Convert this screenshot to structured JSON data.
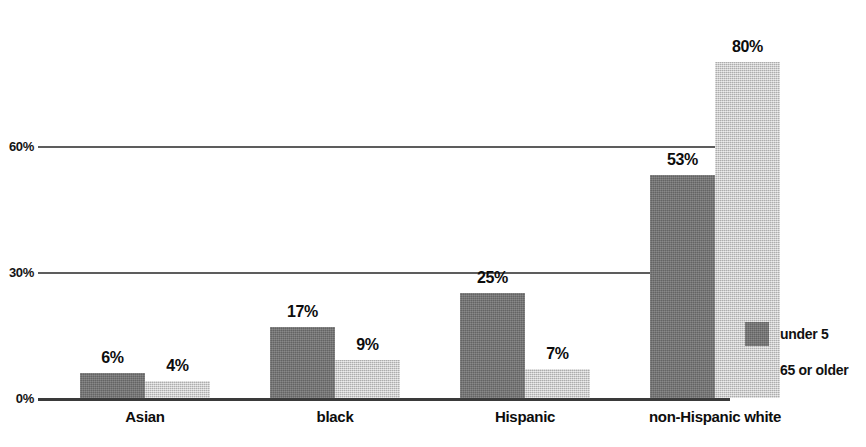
{
  "chart_data": {
    "type": "bar",
    "title": "",
    "subtitle": "",
    "xlabel": "",
    "ylabel": "",
    "categories": [
      "Asian",
      "black",
      "Hispanic",
      "non-Hispanic white"
    ],
    "series": [
      {
        "name": "under 5",
        "values": [
          6,
          17,
          25,
          53
        ],
        "color": "#6f6f6f"
      },
      {
        "name": "65 or older",
        "values": [
          4,
          9,
          7,
          80
        ],
        "color": "#c6c6c6"
      }
    ],
    "value_labels": [
      [
        "6%",
        "17%",
        "25%",
        "53%"
      ],
      [
        "4%",
        "9%",
        "7%",
        "80%"
      ]
    ],
    "ylim": [
      0,
      90
    ],
    "yticks": [
      0,
      30,
      60
    ],
    "ytick_labels": [
      "0%",
      "30%",
      "60%"
    ],
    "grid": true,
    "legend_position": "right",
    "orientation": "vertical",
    "grouping": "grouped"
  },
  "legend": {
    "items": [
      {
        "label": "under 5"
      },
      {
        "label": "65 or older"
      }
    ]
  }
}
